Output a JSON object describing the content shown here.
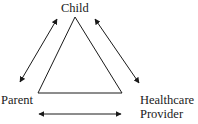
{
  "diagram": {
    "type": "triad",
    "nodes": {
      "child": "Child",
      "parent": "Parent",
      "provider_line1": "Healthcare",
      "provider_line2": "Provider"
    },
    "edges": [
      {
        "from": "Parent",
        "to": "Child",
        "direction": "bidirectional"
      },
      {
        "from": "Child",
        "to": "Healthcare Provider",
        "direction": "bidirectional"
      },
      {
        "from": "Parent",
        "to": "Healthcare Provider",
        "direction": "bidirectional"
      }
    ],
    "colors": {
      "stroke": "#1a1a1a",
      "background": "#ffffff"
    }
  }
}
